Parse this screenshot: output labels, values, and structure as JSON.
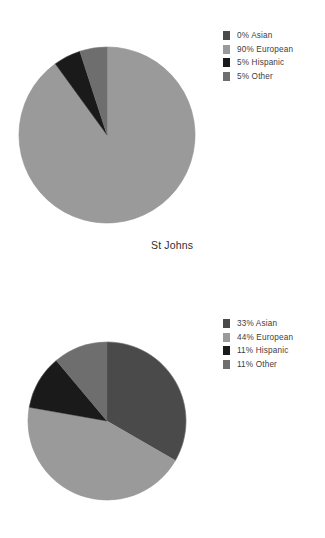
{
  "page": {
    "background": "#ffffff",
    "width": 325,
    "height": 538
  },
  "palette": {
    "asian": "#4a4a4a",
    "european": "#9a9a9a",
    "hispanic": "#1a1a1a",
    "other": "#6e6e6e",
    "outline": "#8a8a8a"
  },
  "charts": [
    {
      "id": "st-johns",
      "caption": "St Johns",
      "legend": [
        {
          "label": "0% Asian",
          "value": 0,
          "category": "Asian",
          "color": "#4a4a4a"
        },
        {
          "label": "90% European",
          "value": 90,
          "category": "European",
          "color": "#9a9a9a"
        },
        {
          "label": "5% Hispanic",
          "value": 5,
          "category": "Hispanic",
          "color": "#1a1a1a"
        },
        {
          "label": "5% Other",
          "value": 5,
          "category": "Other",
          "color": "#6e6e6e"
        }
      ],
      "geometry": {
        "cx": 107,
        "cy": 135,
        "r": 88,
        "legend_top": 29
      }
    },
    {
      "id": "nearby-public-school",
      "caption": "Nearby Public School",
      "legend": [
        {
          "label": "33% Asian",
          "value": 33,
          "category": "Asian",
          "color": "#4a4a4a"
        },
        {
          "label": "44% European",
          "value": 44,
          "category": "European",
          "color": "#9a9a9a"
        },
        {
          "label": "11% Hispanic",
          "value": 11,
          "category": "Hispanic",
          "color": "#1a1a1a"
        },
        {
          "label": "11% Other",
          "value": 11,
          "category": "Other",
          "color": "#6e6e6e"
        }
      ],
      "geometry": {
        "cx": 107,
        "cy": 133,
        "r": 79,
        "legend_top": 29
      }
    }
  ],
  "chart_data": [
    {
      "type": "pie",
      "title": "St Johns",
      "categories": [
        "Asian",
        "European",
        "Hispanic",
        "Other"
      ],
      "values": [
        0,
        90,
        5,
        5
      ],
      "unit": "percent",
      "labels": [
        "0% Asian",
        "90% European",
        "5% Hispanic",
        "5% Other"
      ],
      "colors": [
        "#4a4a4a",
        "#9a9a9a",
        "#1a1a1a",
        "#6e6e6e"
      ],
      "start_angle": 0,
      "direction": "clockwise",
      "legend_position": "right",
      "grid": false
    },
    {
      "type": "pie",
      "title": "Nearby Public School",
      "categories": [
        "Asian",
        "European",
        "Hispanic",
        "Other"
      ],
      "values": [
        33,
        44,
        11,
        11
      ],
      "unit": "percent",
      "labels": [
        "33% Asian",
        "44% European",
        "11% Hispanic",
        "11% Other"
      ],
      "colors": [
        "#4a4a4a",
        "#9a9a9a",
        "#1a1a1a",
        "#6e6e6e"
      ],
      "start_angle": 0,
      "direction": "clockwise",
      "legend_position": "right",
      "grid": false
    }
  ]
}
